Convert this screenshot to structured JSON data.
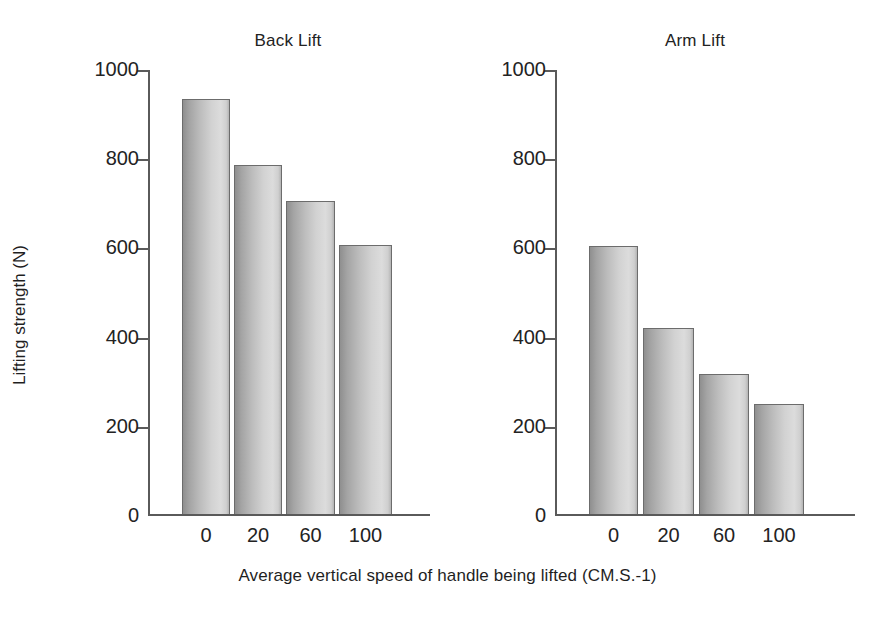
{
  "chart_data": {
    "type": "bar",
    "title": "",
    "xlabel": "Average vertical speed of handle being lifted (CM.S.-1)",
    "ylabel": "Lifting strength (N)",
    "categories": [
      "0",
      "20",
      "60",
      "100"
    ],
    "ylim": [
      0,
      1000
    ],
    "yticks": [
      0,
      200,
      400,
      600,
      800,
      1000
    ],
    "ytick_labels": [
      "0",
      "200",
      "400",
      "600",
      "800",
      "1000"
    ],
    "grid": false,
    "legend": "none",
    "panels": [
      {
        "name": "back-lift",
        "title": "Back Lift",
        "values": [
          930,
          783,
          702,
          604
        ]
      },
      {
        "name": "arm-lift",
        "title": "Arm Lift",
        "values": [
          600,
          418,
          315,
          247
        ]
      }
    ],
    "bar_fill_light": "#dcdcdc",
    "bar_fill_dark": "#8f8f8f",
    "axis_color": "#5a5a5a"
  }
}
